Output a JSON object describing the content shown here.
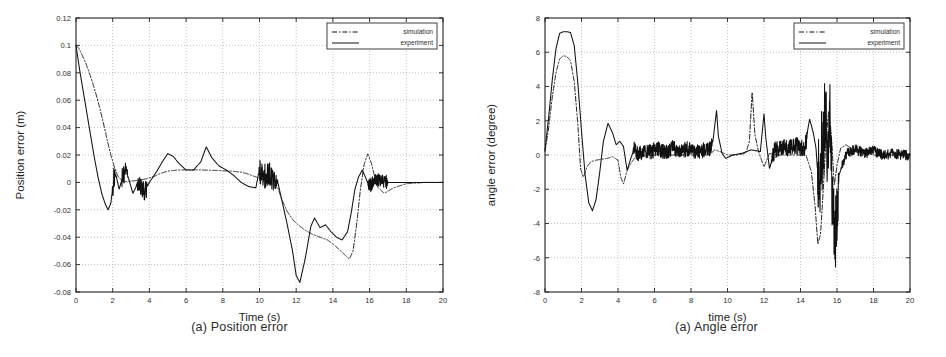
{
  "figure": {
    "background": "#ffffff",
    "line_color": "#111111",
    "grid_color": "#9a9a9a"
  },
  "panels": [
    {
      "id": "position-error",
      "caption": "(a) Position error",
      "legend": {
        "position": "top-right",
        "entries": [
          {
            "label": "simulation",
            "style": "dash-dot"
          },
          {
            "label": "experiment",
            "style": "solid"
          }
        ]
      },
      "chart_data": {
        "type": "line",
        "title": "",
        "xlabel": "Time (s)",
        "ylabel": "Position error (m)",
        "xlim": [
          0,
          20
        ],
        "ylim": [
          -0.08,
          0.12
        ],
        "xticks": [
          0,
          2,
          4,
          6,
          8,
          10,
          12,
          14,
          16,
          18,
          20
        ],
        "xtick_labels": [
          "0",
          "2",
          "4",
          "6",
          "8",
          "10",
          "12",
          "14",
          "16",
          "18",
          "20"
        ],
        "yticks": [
          -0.08,
          -0.06,
          -0.04,
          -0.02,
          0,
          0.02,
          0.04,
          0.06,
          0.08,
          0.1,
          0.12
        ],
        "ytick_labels": [
          "-0.08",
          "-0.06",
          "-0.04",
          "-0.02",
          "0",
          "0.02",
          "0.04",
          "0.06",
          "0.08",
          "0.1",
          "0.12"
        ],
        "grid": true,
        "legend_position": "upper right",
        "series": [
          {
            "name": "simulation",
            "style": "dash-dot",
            "x": [
              0,
              0.15,
              0.3,
              0.5,
              0.7,
              0.9,
              1.1,
              1.3,
              1.5,
              1.7,
              1.9,
              2.1,
              2.3,
              2.6,
              3.0,
              3.4,
              3.8,
              4.2,
              4.6,
              5.0,
              5.5,
              6.0,
              6.5,
              7.0,
              7.5,
              8.0,
              8.5,
              9.0,
              9.4,
              9.8,
              10.2,
              10.6,
              11.0,
              11.2,
              11.5,
              11.8,
              12.1,
              12.5,
              12.9,
              13.3,
              13.7,
              14.1,
              14.5,
              14.9,
              15.1,
              15.3,
              15.5,
              15.7,
              15.9,
              16.1,
              16.4,
              16.8,
              17.3,
              18.0,
              19.0,
              20.0
            ],
            "y": [
              0.1,
              0.098,
              0.094,
              0.088,
              0.081,
              0.073,
              0.064,
              0.054,
              0.043,
              0.031,
              0.02,
              0.011,
              0.004,
              0.0005,
              0.001,
              0.0015,
              0.0025,
              0.004,
              0.0065,
              0.0082,
              0.009,
              0.0092,
              0.0092,
              0.009,
              0.0088,
              0.0085,
              0.0082,
              0.0075,
              0.006,
              0.004,
              0.002,
              0.0,
              -0.004,
              -0.012,
              -0.021,
              -0.027,
              -0.031,
              -0.035,
              -0.038,
              -0.04,
              -0.042,
              -0.046,
              -0.051,
              -0.056,
              -0.05,
              -0.03,
              -0.005,
              0.013,
              0.021,
              0.014,
              -0.003,
              -0.008,
              -0.004,
              -0.001,
              0.0,
              0.0
            ]
          },
          {
            "name": "experiment",
            "style": "solid",
            "x": [
              0,
              0.2,
              0.4,
              0.6,
              0.8,
              1.0,
              1.2,
              1.4,
              1.6,
              1.75,
              1.9,
              2.0,
              2.1,
              2.2,
              2.35,
              2.5,
              2.65,
              2.8,
              2.95,
              3.1,
              3.25,
              3.4,
              3.55,
              3.7,
              3.85,
              4.0,
              4.2,
              4.4,
              4.7,
              5.0,
              5.3,
              5.6,
              6.0,
              6.4,
              6.8,
              7.1,
              7.4,
              7.8,
              8.2,
              8.6,
              9.0,
              9.4,
              9.8,
              10.0,
              10.2,
              10.5,
              10.8,
              11.0,
              11.2,
              11.5,
              11.8,
              12.0,
              12.2,
              12.5,
              12.8,
              13.0,
              13.3,
              13.6,
              13.9,
              14.2,
              14.5,
              14.8,
              15.0,
              15.2,
              15.4,
              15.6,
              15.8,
              16.0,
              16.2,
              16.5,
              17.0,
              17.5,
              18.0,
              19.0,
              20.0
            ],
            "y": [
              0.1,
              0.082,
              0.066,
              0.05,
              0.034,
              0.018,
              0.004,
              -0.008,
              -0.016,
              -0.02,
              -0.015,
              -0.004,
              0.008,
              0.004,
              -0.005,
              0.002,
              0.009,
              0.006,
              -0.001,
              -0.008,
              -0.004,
              0.002,
              -0.002,
              -0.008,
              -0.004,
              0.0,
              0.004,
              0.008,
              0.015,
              0.021,
              0.019,
              0.014,
              0.009,
              0.009,
              0.015,
              0.026,
              0.018,
              0.012,
              0.009,
              0.005,
              0.0,
              -0.003,
              -0.004,
              0.01,
              0.004,
              0.008,
              0.002,
              0.0,
              -0.012,
              -0.03,
              -0.05,
              -0.068,
              -0.073,
              -0.055,
              -0.032,
              -0.026,
              -0.033,
              -0.031,
              -0.036,
              -0.04,
              -0.042,
              -0.036,
              -0.022,
              -0.005,
              0.004,
              0.009,
              0.003,
              -0.004,
              0.001,
              0.002,
              0.0,
              0.0,
              0.0,
              0.0,
              0.0
            ],
            "noise_bursts": [
              {
                "t_start": 1.95,
                "t_end": 2.15,
                "amp": 0.009,
                "center": 0.0
              },
              {
                "t_start": 2.45,
                "t_end": 2.85,
                "amp": 0.008,
                "center": 0.003
              },
              {
                "t_start": 3.3,
                "t_end": 3.9,
                "amp": 0.007,
                "center": -0.004
              },
              {
                "t_start": 9.95,
                "t_end": 11.0,
                "amp": 0.009,
                "center": 0.002
              },
              {
                "t_start": 15.9,
                "t_end": 17.0,
                "amp": 0.005,
                "center": 0.001
              }
            ]
          }
        ]
      }
    },
    {
      "id": "angle-error",
      "caption": "(a) Angle error",
      "legend": {
        "position": "top-right",
        "entries": [
          {
            "label": "simulation",
            "style": "dash-dot"
          },
          {
            "label": "experiment",
            "style": "solid"
          }
        ]
      },
      "chart_data": {
        "type": "line",
        "title": "",
        "xlabel": "time (s)",
        "ylabel": "angle error (degree)",
        "xlim": [
          0,
          20
        ],
        "ylim": [
          -8,
          8
        ],
        "xticks": [
          0,
          2,
          4,
          6,
          8,
          10,
          12,
          14,
          16,
          18,
          20
        ],
        "xtick_labels": [
          "0",
          "2",
          "4",
          "6",
          "8",
          "10",
          "12",
          "14",
          "16",
          "18",
          "20"
        ],
        "yticks": [
          -8,
          -6,
          -4,
          -2,
          0,
          2,
          4,
          6,
          8
        ],
        "ytick_labels": [
          "-8",
          "-6",
          "-4",
          "-2",
          "0",
          "2",
          "4",
          "6",
          "8"
        ],
        "grid": true,
        "legend_position": "upper right",
        "series": [
          {
            "name": "simulation",
            "style": "dash-dot",
            "x": [
              0,
              0.2,
              0.4,
              0.6,
              0.8,
              1.0,
              1.2,
              1.4,
              1.6,
              1.8,
              1.95,
              2.1,
              2.3,
              2.5,
              2.8,
              3.1,
              3.4,
              3.7,
              4.0,
              4.15,
              4.3,
              4.5,
              4.7,
              4.9,
              5.2,
              5.6,
              6.0,
              6.5,
              7.0,
              7.5,
              8.0,
              8.5,
              9.0,
              9.3,
              9.6,
              10.0,
              10.5,
              11.0,
              11.2,
              11.35,
              11.5,
              11.7,
              12.0,
              12.3,
              12.7,
              13.1,
              13.5,
              13.9,
              14.3,
              14.6,
              14.8,
              14.95,
              15.1,
              15.25,
              15.4,
              15.55,
              15.7,
              15.85,
              16.0,
              16.2,
              16.5,
              17.0,
              17.5,
              18.0,
              19.0,
              20.0
            ],
            "y": [
              0.2,
              1.6,
              3.4,
              4.8,
              5.6,
              5.8,
              5.75,
              5.5,
              4.3,
              1.8,
              -0.8,
              -1.3,
              -0.7,
              -0.4,
              -0.3,
              -0.25,
              -0.2,
              -0.1,
              -0.3,
              -1.3,
              -1.7,
              -0.9,
              -0.5,
              -0.2,
              -0.1,
              0.0,
              0.0,
              0.0,
              0.0,
              0.0,
              0.0,
              0.0,
              0.0,
              0.3,
              0.2,
              0.0,
              0.0,
              0.1,
              0.8,
              3.7,
              1.2,
              0.2,
              -0.7,
              0.1,
              0.0,
              0.0,
              0.0,
              0.0,
              0.0,
              -1.0,
              -3.0,
              -5.2,
              -4.6,
              -2.0,
              1.0,
              2.6,
              1.0,
              -1.8,
              -0.6,
              0.4,
              0.6,
              0.2,
              0.1,
              0.0,
              0.0,
              0.0
            ]
          },
          {
            "name": "experiment",
            "style": "solid",
            "x": [
              0,
              0.2,
              0.4,
              0.6,
              0.8,
              1.0,
              1.2,
              1.4,
              1.6,
              1.8,
              2.0,
              2.2,
              2.4,
              2.6,
              2.8,
              3.0,
              3.2,
              3.45,
              3.7,
              3.9,
              4.1,
              4.3,
              4.5,
              4.7,
              4.9,
              5.1,
              5.4,
              5.8,
              6.2,
              6.6,
              7.0,
              7.4,
              7.8,
              8.2,
              8.6,
              9.0,
              9.2,
              9.4,
              9.5,
              9.7,
              9.9,
              10.3,
              10.8,
              11.3,
              11.8,
              12.0,
              12.1,
              12.3,
              12.6,
              13.0,
              13.4,
              13.8,
              14.2,
              14.5,
              14.7,
              14.85,
              15.0,
              15.2,
              15.4,
              15.5,
              15.6,
              15.75,
              15.9,
              16.0,
              16.1,
              16.3,
              16.6,
              17.0,
              17.5,
              18.0,
              18.5,
              19.0,
              19.5,
              20.0
            ],
            "y": [
              0.3,
              2.2,
              4.4,
              6.2,
              7.1,
              7.2,
              7.2,
              7.15,
              6.4,
              4.2,
              1.4,
              -1.2,
              -2.8,
              -3.25,
              -2.6,
              -1.0,
              0.8,
              1.85,
              1.3,
              0.6,
              0.8,
              0.5,
              -0.9,
              -0.2,
              0.4,
              -0.1,
              0.3,
              0.2,
              0.4,
              0.1,
              0.5,
              0.2,
              0.4,
              0.1,
              0.3,
              0.4,
              0.8,
              2.6,
              1.1,
              0.1,
              -0.2,
              0.0,
              0.1,
              0.3,
              0.2,
              2.4,
              1.0,
              -0.8,
              0.3,
              0.5,
              0.4,
              0.6,
              0.3,
              2.1,
              1.3,
              0.4,
              -2.0,
              1.0,
              3.3,
              -1.5,
              2.8,
              -4.5,
              -6.4,
              -4.8,
              -1.2,
              -0.6,
              0.2,
              0.4,
              0.1,
              0.3,
              0.0,
              0.1,
              0.0,
              0.0
            ],
            "noise_bursts": [
              {
                "t_start": 4.8,
                "t_end": 9.2,
                "amp": 0.45,
                "center": 0.2
              },
              {
                "t_start": 12.4,
                "t_end": 14.4,
                "amp": 0.5,
                "center": 0.35
              },
              {
                "t_start": 14.9,
                "t_end": 16.1,
                "amp": 2.6,
                "center": -0.8
              },
              {
                "t_start": 16.2,
                "t_end": 20.0,
                "amp": 0.3,
                "center": 0.05
              }
            ]
          }
        ]
      }
    }
  ]
}
